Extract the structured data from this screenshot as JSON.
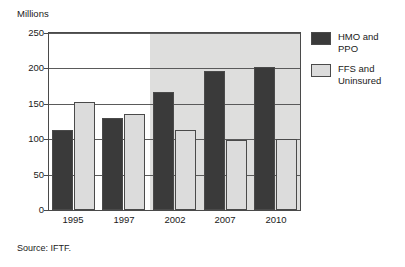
{
  "chart_data": {
    "type": "bar",
    "title": "",
    "subtitle": "",
    "unit_label": "Millions",
    "xlabel": "",
    "ylabel": "Millions",
    "categories": [
      "1995",
      "1997",
      "2002",
      "2007",
      "2010"
    ],
    "series": [
      {
        "name": "HMO and PPO",
        "color": "#3a3a3a",
        "values": [
          113,
          130,
          167,
          196,
          202
        ]
      },
      {
        "name": "FFS and Uninsured",
        "color": "#dcdcdc",
        "values": [
          152,
          135,
          113,
          99,
          100
        ]
      }
    ],
    "ylim": [
      0,
      250
    ],
    "yticks": [
      0,
      50,
      100,
      150,
      200,
      250
    ],
    "ytick_labels": [
      "0",
      "50",
      "100",
      "150",
      "200",
      "250"
    ],
    "grid": "horizontal",
    "legend_position": "right",
    "annotations": {
      "forecast_shading_starts_at": "2002",
      "forecast_shading_note": "grey band covers projected years 2002, 2007 and 2010"
    },
    "source": "Source: IFTF."
  },
  "legend": {
    "items": [
      {
        "label": "HMO and\nPPO",
        "line1": "HMO and",
        "line2": "PPO",
        "color": "#3a3a3a"
      },
      {
        "label": "FFS and\nUninsured",
        "line1": "FFS and",
        "line2": "Uninsured",
        "color": "#dcdcdc"
      }
    ]
  },
  "footer": {
    "source": "Source: IFTF."
  },
  "colors": {
    "series_dark": "#3a3a3a",
    "series_light": "#dcdcdc",
    "forecast_band": "#dededd",
    "axis": "#4a4a4a",
    "gridline": "#5a5a5a",
    "text": "#1a1a1a",
    "background": "#ffffff"
  }
}
